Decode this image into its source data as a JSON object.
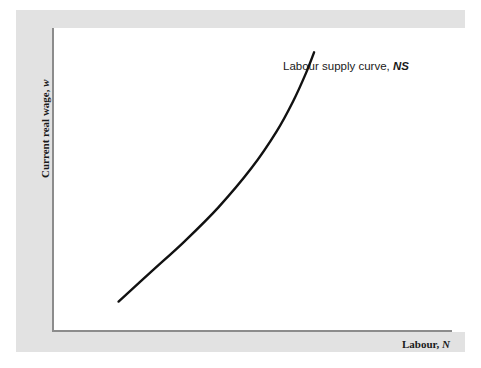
{
  "figure": {
    "panel_color": "#e2e2e2",
    "plot_background": "#ffffff",
    "axis_color": "#8c8c8c",
    "curve_color": "#111111"
  },
  "axes": {
    "y_title_text": "Current real wage, ",
    "y_title_variable": "w",
    "x_title_text": "Labour, ",
    "x_title_variable": "N"
  },
  "annotations": {
    "curve_label_text": "Labour supply curve, ",
    "curve_label_variable": "NS"
  },
  "chart_data": {
    "type": "line",
    "title": "",
    "xlabel": "Labour, N",
    "ylabel": "Current real wage, w",
    "grid": false,
    "legend": "none",
    "axis_ticks": [],
    "xlim": [
      0,
      100
    ],
    "ylim": [
      0,
      100
    ],
    "series": [
      {
        "name": "Labour supply curve, NS",
        "description": "Upward-sloping convex curve; slope increases with labour",
        "x": [
          16,
          24,
          32,
          40,
          48,
          54,
          58,
          61,
          63
        ],
        "y": [
          10,
          20,
          30,
          41,
          54,
          66,
          76,
          85,
          92
        ]
      }
    ],
    "annotations": [
      {
        "text": "Labour supply curve, NS",
        "x": 66,
        "y": 96
      }
    ]
  }
}
